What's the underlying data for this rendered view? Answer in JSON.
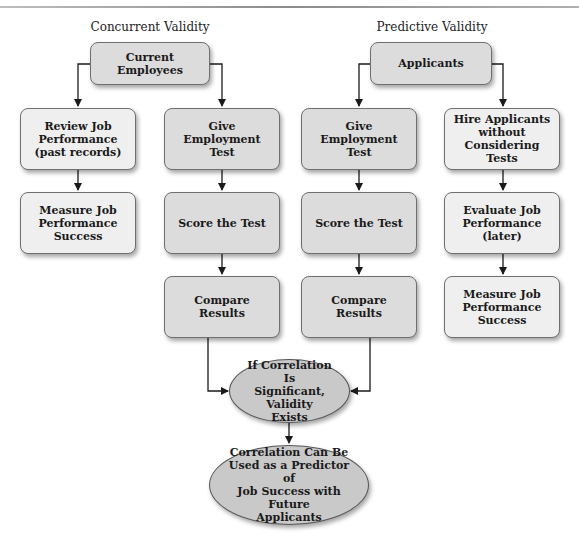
{
  "diagram": {
    "sections": [
      {
        "heading": "Concurrent Validity",
        "start": "Current Employees",
        "left_branch": [
          "Review Job\nPerformance\n(past records)",
          "Measure Job\nPerformance\nSuccess"
        ],
        "right_branch": [
          "Give Employment\nTest",
          "Score the Test",
          "Compare Results"
        ]
      },
      {
        "heading": "Predictive Validity",
        "start": "Applicants",
        "left_branch": [
          "Give Employment\nTest",
          "Score the Test",
          "Compare Results"
        ],
        "right_branch": [
          "Hire Applicants\nwithout\nConsidering Tests",
          "Evaluate Job\nPerformance (later)",
          "Measure Job\nPerformance\nSuccess"
        ]
      }
    ],
    "merge": "If Correlation Is\nSignificant, Validity\nExists",
    "outcome": "Correlation Can Be\nUsed as a Predictor of\nJob Success with Future\nApplicants",
    "colors": {
      "light_box": "#efefef",
      "dark_box": "#dcdcdc",
      "ellipse": "#c9c9c9",
      "border": "#6f6f6f",
      "line": "#1a1a1a"
    }
  }
}
